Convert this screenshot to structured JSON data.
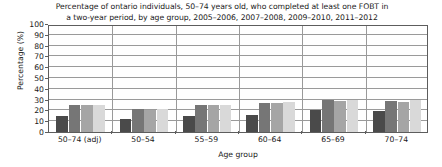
{
  "chart_data": {
    "type": "bar",
    "title": "Percentage of ontario individuals, 50–74 years old, who completed at least one FOBT in a two-year period, by age group, 2005–2006, 2007–2008, 2009–2010, 2011–2012",
    "title_line1": "Percentage of ontario individuals, 50–74 years old, who completed at least one FOBT in",
    "title_line2": "a two-year period, by age group, 2005–2006, 2007–2008, 2009–2010, 2011–2012",
    "xlabel": "Age group",
    "ylabel": "Percentage (%)",
    "ylim": [
      0,
      100
    ],
    "ytick_step": 10,
    "yticks": [
      100,
      90,
      80,
      70,
      60,
      50,
      40,
      30,
      20,
      10,
      0
    ],
    "grid": true,
    "legend_position": "none",
    "categories": [
      "50–74 (adj)",
      "50–54",
      "55–59",
      "60–64",
      "65–69",
      "70–74"
    ],
    "series": [
      {
        "name": "2005–2006",
        "color": "#4a4a4a",
        "values": [
          15,
          12,
          15,
          16,
          20,
          19
        ]
      },
      {
        "name": "2007–2008",
        "color": "#767676",
        "values": [
          25,
          21,
          25,
          27,
          30,
          29
        ]
      },
      {
        "name": "2009–2010",
        "color": "#a5a5a5",
        "values": [
          25,
          20,
          25,
          27,
          29,
          28
        ]
      },
      {
        "name": "2011–2012",
        "color": "#d9d9d9",
        "values": [
          25,
          21,
          25,
          28,
          30,
          30
        ]
      }
    ]
  }
}
